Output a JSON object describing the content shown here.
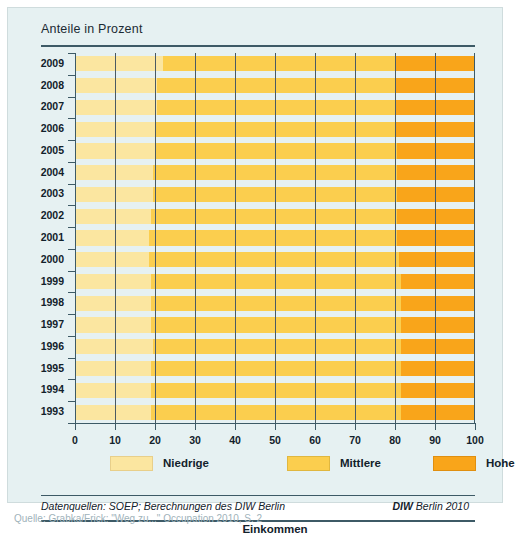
{
  "header": {
    "title": "Anteile in Prozent"
  },
  "footer": {
    "source": "Datenquellen: SOEP; Berechnungen des DIW Berlin",
    "publisher_bold": "DIW",
    "publisher_rest": " Berlin 2010"
  },
  "caption": "Quelle: Grabka/Frick: \"Weg zu...\" Occupation 2010, S. 2",
  "colors": {
    "low": "#fbe6a0",
    "mid": "#fbce4e",
    "high": "#f9a51a",
    "background": "#e6f1f2",
    "axis": "#3d5a66",
    "grid": "#4a5a63",
    "text": "#12212b"
  },
  "legend": [
    {
      "key": "low",
      "label": "Niedrige"
    },
    {
      "key": "mid",
      "label": "Mittlere"
    },
    {
      "key": "high",
      "label": "Hohe"
    }
  ],
  "chart_data": {
    "type": "bar",
    "orientation": "horizontal",
    "stacked": true,
    "normalized_percent": true,
    "title": "Anteile in Prozent",
    "xlabel": "Einkommen",
    "ylabel": "",
    "xlim": [
      0,
      100
    ],
    "xticks": [
      0,
      10,
      20,
      30,
      40,
      50,
      60,
      70,
      80,
      90,
      100
    ],
    "xticklabels": [
      "0",
      "10",
      "20",
      "30",
      "40",
      "50",
      "60",
      "70",
      "80",
      "90",
      "100"
    ],
    "grid": true,
    "legend_position": "bottom",
    "categories": [
      "2009",
      "2008",
      "2007",
      "2006",
      "2005",
      "2004",
      "2003",
      "2002",
      "2001",
      "2000",
      "1999",
      "1998",
      "1997",
      "1996",
      "1995",
      "1994",
      "1993"
    ],
    "series": [
      {
        "name": "Niedrige",
        "color": "#fbe6a0",
        "values": [
          22.0,
          20.5,
          20.5,
          20.0,
          20.0,
          19.5,
          19.5,
          19.0,
          18.5,
          18.5,
          19.0,
          19.0,
          19.0,
          19.5,
          19.0,
          19.0,
          19.0
        ]
      },
      {
        "name": "Mittlere",
        "color": "#fbce4e",
        "values": [
          58.0,
          59.5,
          59.5,
          60.0,
          60.5,
          61.0,
          61.0,
          61.5,
          62.0,
          62.5,
          62.5,
          62.5,
          62.5,
          62.0,
          62.5,
          62.5,
          62.5
        ]
      },
      {
        "name": "Hohe",
        "color": "#f9a51a",
        "values": [
          20.0,
          20.0,
          20.0,
          20.0,
          19.5,
          19.5,
          19.5,
          19.5,
          19.5,
          19.0,
          18.5,
          18.5,
          18.5,
          18.5,
          18.5,
          18.5,
          18.5
        ]
      }
    ]
  }
}
